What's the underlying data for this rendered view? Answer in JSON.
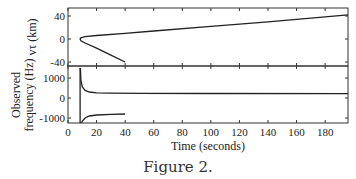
{
  "caption": "Figure 2.",
  "chart_data": [
    {
      "type": "line",
      "panel": "top",
      "ylabel": "vτ (km)",
      "xlabel": "",
      "ylim": [
        -45,
        50
      ],
      "xlim": [
        0,
        196
      ],
      "yticks": [
        -40,
        0,
        40
      ],
      "ytick_labels": [
        "-40",
        "0",
        "40"
      ],
      "xticks": [
        0,
        20,
        40,
        60,
        80,
        100,
        120,
        140,
        160,
        180
      ],
      "series": [
        {
          "name": "vτ",
          "x": [
            40,
            30,
            20,
            12,
            9,
            8.5,
            9,
            12,
            20,
            40,
            60,
            100,
            140,
            196
          ],
          "y": [
            -40,
            -28,
            -16,
            -7,
            -3,
            0,
            2,
            4,
            6,
            10,
            14,
            22,
            30,
            42
          ]
        }
      ],
      "grid": false
    },
    {
      "type": "line",
      "panel": "bottom",
      "ylabel": "Observed frequency (Hz)",
      "xlabel": "Time (seconds)",
      "ylim": [
        -1350,
        1500
      ],
      "xlim": [
        0,
        196
      ],
      "yticks": [
        -1000,
        0,
        1000
      ],
      "ytick_labels": [
        "-1000",
        "0",
        "1000"
      ],
      "xticks": [
        0,
        20,
        40,
        60,
        80,
        100,
        120,
        140,
        160,
        180
      ],
      "xtick_labels": [
        "0",
        "20",
        "40",
        "60",
        "80",
        "100",
        "120",
        "140",
        "160",
        "180"
      ],
      "series": [
        {
          "name": "upper branch",
          "x": [
            8.7,
            9,
            10,
            12,
            15,
            20,
            30,
            50,
            100,
            196
          ],
          "y": [
            1500,
            900,
            550,
            380,
            300,
            260,
            240,
            230,
            225,
            220
          ]
        },
        {
          "name": "lower branch",
          "x": [
            9,
            10,
            12,
            15,
            20,
            30,
            40
          ],
          "y": [
            -1350,
            -1150,
            -1000,
            -900,
            -850,
            -820,
            -800
          ]
        },
        {
          "name": "vertical asymptote",
          "x": [
            8.5,
            8.5
          ],
          "y": [
            1500,
            -1350
          ]
        }
      ],
      "grid": false
    }
  ]
}
